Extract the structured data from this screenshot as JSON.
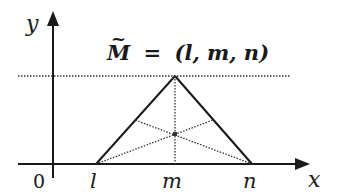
{
  "diagram": {
    "type": "triangular-fuzzy-number",
    "title_label": "M̃ = (l, m, n)",
    "title_parts": {
      "symbol": "M",
      "tilde": "~",
      "equals": "=",
      "tuple": "(l, m, n)"
    },
    "axes": {
      "x_label": "x",
      "y_label": "y",
      "origin_label": "0"
    },
    "points": {
      "l": {
        "label": "l",
        "x": 96,
        "y": 164
      },
      "m": {
        "label": "m",
        "x": 175,
        "y": 164
      },
      "n": {
        "label": "n",
        "x": 252,
        "y": 164
      },
      "apex": {
        "x": 175,
        "y": 76
      },
      "centroid": {
        "x": 175,
        "y": 134
      }
    },
    "lines": {
      "triangle": "solid",
      "apex_level": "dotted horizontal",
      "altitude_to_m": "dotted vertical",
      "medians": "dotted"
    },
    "colors": {
      "stroke": "#1a1a1a",
      "dotted": "#333333",
      "background": "#ffffff"
    }
  }
}
